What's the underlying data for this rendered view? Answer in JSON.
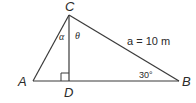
{
  "diagram": {
    "type": "right-triangle",
    "vertices": {
      "A": "A",
      "B": "B",
      "C": "C",
      "D": "D"
    },
    "angles": {
      "alpha": "α",
      "theta": "θ",
      "angle_B": "30°"
    },
    "sides": {
      "hypotenuse_CB": "a = 10 m"
    },
    "line_color": "#3a3a3a"
  }
}
